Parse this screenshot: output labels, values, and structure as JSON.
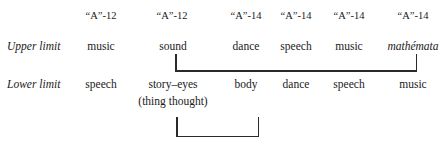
{
  "headers": [
    "“A”-12",
    "“A”-12",
    "“A”-14",
    "“A”-14",
    "“A”-14",
    "“A”-14"
  ],
  "rows": {
    "upper": {
      "label": "Upper limit",
      "cells": [
        "music",
        "sound",
        "dance",
        "speech",
        "music",
        "mathémata"
      ]
    },
    "lower": {
      "label": "Lower limit",
      "cells": [
        "speech",
        "story–eyes",
        "body",
        "dance",
        "speech",
        "music"
      ],
      "subtext": "(thing thought)"
    }
  },
  "brackets": {
    "upper": {
      "from": "sound",
      "to": "mathémata"
    },
    "lower": {
      "from": "story–eyes",
      "to": "body"
    }
  }
}
